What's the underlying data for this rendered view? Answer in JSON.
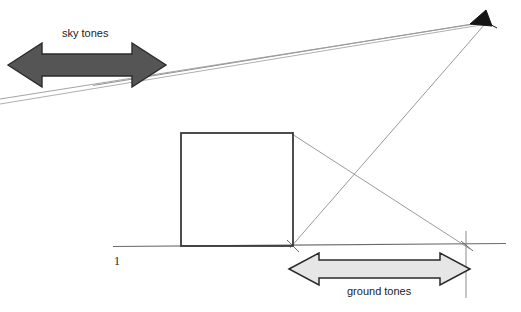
{
  "diagram": {
    "labels": {
      "sky_tones": "sky tones",
      "ground_tones": "ground tones",
      "plane_number": "1"
    },
    "colors": {
      "background": "#ffffff",
      "line": "#4a4a4a",
      "construction_line": "#8a8a8a",
      "box_outline": "#3a3a3a",
      "sky_arrow_fill": "#555555",
      "sky_arrow_stroke": "#2b2b2b",
      "ground_arrow_fill": "#e6e6e6",
      "ground_arrow_stroke": "#2b2b2b",
      "vanishing_point_marker": "#111111",
      "text": "#1b1b1b"
    },
    "geometry": {
      "vanishing_point": {
        "x": 485,
        "y": 22
      },
      "horizon_line": {
        "x1": 113,
        "y1": 246,
        "x2": 506,
        "y2": 243
      },
      "box": {
        "left": 181,
        "top": 133,
        "right": 293,
        "bottom": 246
      },
      "right_vertical_line": {
        "x": 466,
        "y_top": 232,
        "y_bottom": 296
      },
      "construction_lines": [
        {
          "name": "vp-to-upper-left-sky",
          "x1": 485,
          "y1": 22,
          "x2": 88,
          "y2": 18
        },
        {
          "name": "vp-to-box-top-left",
          "x1": 485,
          "y1": 22,
          "x2": 181,
          "y2": 133
        },
        {
          "name": "vp-to-lower-left-edge",
          "x1": 485,
          "y1": 22,
          "x2": 0,
          "y2": 99
        },
        {
          "name": "vp-to-box-bottom-right",
          "x1": 485,
          "y1": 22,
          "x2": 293,
          "y2": 246
        },
        {
          "name": "vp-to-horizon-right-mark",
          "x1": 485,
          "y1": 22,
          "x2": 466,
          "y2": 246
        },
        {
          "name": "box-top-right-to-horizon-right",
          "x1": 293,
          "y1": 133,
          "x2": 466,
          "y2": 246
        }
      ],
      "sky_arrow": {
        "x_left": 8,
        "x_right": 166,
        "y_center": 65,
        "shaft_half_height": 11,
        "head_half_height": 22,
        "head_length": 34
      },
      "ground_arrow": {
        "x_left": 289,
        "x_right": 470,
        "y_center": 269,
        "shaft_half_height": 9,
        "head_half_height": 16,
        "head_length": 30
      }
    }
  }
}
